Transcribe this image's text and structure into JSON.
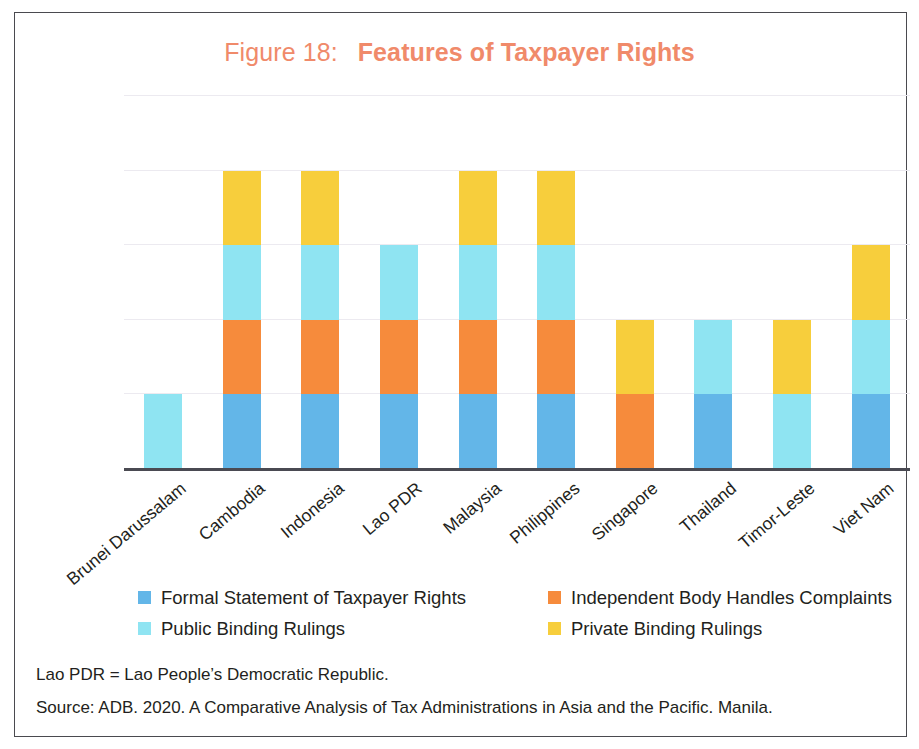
{
  "figure": {
    "label": "Figure 18:",
    "title": "Features of Taxpayer Rights",
    "title_color": "#F08A6A"
  },
  "notes": {
    "abbreviation": "Lao PDR = Lao People’s Democratic Republic.",
    "source": "Source: ADB. 2020. A Comparative Analysis of Tax Administrations in Asia and the Pacific. Manila."
  },
  "legend": {
    "items": [
      {
        "label": "Formal Statement of Taxpayer Rights",
        "color": "#63B6E8"
      },
      {
        "label": "Independent Body Handles Complaints",
        "color": "#F68B3C"
      },
      {
        "label": "Public Binding Rulings",
        "color": "#8FE4F2"
      },
      {
        "label": "Private Binding Rulings",
        "color": "#F7CE3C"
      }
    ]
  },
  "chart_data": {
    "type": "bar",
    "stacked": true,
    "xlabel": "",
    "ylabel": "",
    "ylim": [
      0,
      5
    ],
    "grid": true,
    "gridline_values": [
      1,
      2,
      3,
      4,
      5
    ],
    "y_tick_labels": [],
    "legend_position": "bottom",
    "note": "Each segment indicates presence (1) of the feature for that economy; stack height = number of features present.",
    "categories": [
      "Brunei Darussalam",
      "Cambodia",
      "Indonesia",
      "Lao PDR",
      "Malaysia",
      "Philippines",
      "Singapore",
      "Thailand",
      "Timor-Leste",
      "Viet Nam"
    ],
    "series": [
      {
        "name": "Formal Statement of Taxpayer Rights",
        "color": "#63B6E8",
        "values": [
          0,
          1,
          1,
          1,
          1,
          1,
          0,
          1,
          0,
          1
        ]
      },
      {
        "name": "Independent Body Handles Complaints",
        "color": "#F68B3C",
        "values": [
          0,
          1,
          1,
          1,
          1,
          1,
          1,
          0,
          0,
          0
        ]
      },
      {
        "name": "Public Binding Rulings",
        "color": "#8FE4F2",
        "values": [
          1,
          1,
          1,
          1,
          1,
          1,
          0,
          1,
          1,
          1
        ]
      },
      {
        "name": "Private Binding Rulings",
        "color": "#F7CE3C",
        "values": [
          0,
          1,
          1,
          0,
          1,
          1,
          1,
          0,
          1,
          1
        ]
      }
    ],
    "totals": [
      1,
      4,
      4,
      3,
      4,
      4,
      2,
      2,
      2,
      3
    ]
  }
}
